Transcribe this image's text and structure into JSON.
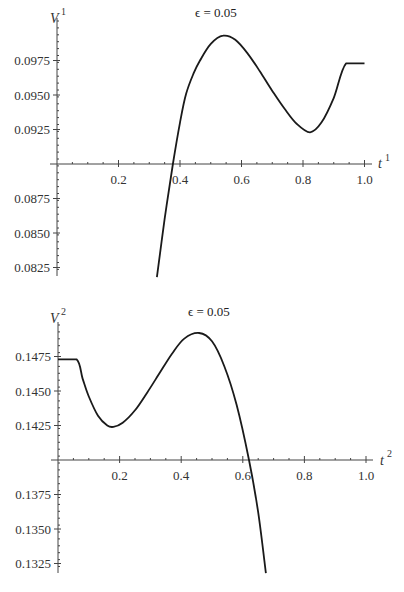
{
  "chart_data": [
    {
      "type": "line",
      "title": "ϵ = 0.05",
      "xlabel": "t",
      "xlabel_sup": "1",
      "ylabel": "V",
      "ylabel_sup": "1",
      "xlim": [
        0,
        1.0
      ],
      "ylim": [
        0.0818,
        0.1
      ],
      "x_axis_crosses_y_at": 0.09,
      "x_ticks": [
        "0.2",
        "0.4",
        "0.6",
        "0.8",
        "1.0"
      ],
      "x_tick_values": [
        0.2,
        0.4,
        0.6,
        0.8,
        1.0
      ],
      "y_ticks": [
        "0.0975",
        "0.0950",
        "0.0925",
        "0.0875",
        "0.0850",
        "0.0825"
      ],
      "y_tick_values": [
        0.0975,
        0.095,
        0.0925,
        0.0875,
        0.085,
        0.0825
      ],
      "grid": false,
      "series": [
        {
          "name": "V1",
          "x": [
            0.325,
            0.35,
            0.377,
            0.4,
            0.42,
            0.445,
            0.465,
            0.5,
            0.54,
            0.58,
            0.62,
            0.66,
            0.7,
            0.74,
            0.78,
            0.823,
            0.86,
            0.9,
            0.94,
            1.0
          ],
          "y": [
            0.0818,
            0.086,
            0.09,
            0.093,
            0.0951,
            0.0966,
            0.0975,
            0.0987,
            0.0993,
            0.099,
            0.098,
            0.0967,
            0.0953,
            0.094,
            0.0929,
            0.0923,
            0.093,
            0.0948,
            0.0973,
            0.0973
          ]
        }
      ]
    },
    {
      "type": "line",
      "title": "ϵ = 0.05",
      "xlabel": "t",
      "xlabel_sup": "2",
      "ylabel": "V",
      "ylabel_sup": "2",
      "xlim": [
        0,
        1.0
      ],
      "ylim": [
        0.1318,
        0.15
      ],
      "x_axis_crosses_y_at": 0.14,
      "x_ticks": [
        "0.2",
        "0.4",
        "0.6",
        "0.8",
        "1.0"
      ],
      "x_tick_values": [
        0.2,
        0.4,
        0.6,
        0.8,
        1.0
      ],
      "y_ticks": [
        "0.1475",
        "0.1450",
        "0.1425",
        "0.1375",
        "0.1350",
        "0.1325"
      ],
      "y_tick_values": [
        0.1475,
        0.145,
        0.1425,
        0.1375,
        0.135,
        0.1325
      ],
      "grid": false,
      "series": [
        {
          "name": "V2",
          "x": [
            0.0,
            0.06,
            0.08,
            0.1,
            0.13,
            0.16,
            0.18,
            0.21,
            0.25,
            0.29,
            0.33,
            0.37,
            0.41,
            0.458,
            0.5,
            0.54,
            0.58,
            0.62,
            0.65,
            0.675
          ],
          "y": [
            0.1473,
            0.1473,
            0.1459,
            0.1446,
            0.1432,
            0.1425,
            0.1424,
            0.1427,
            0.1436,
            0.1449,
            0.1463,
            0.1477,
            0.1488,
            0.1492,
            0.1486,
            0.1468,
            0.144,
            0.14,
            0.1362,
            0.1318
          ]
        }
      ]
    }
  ]
}
